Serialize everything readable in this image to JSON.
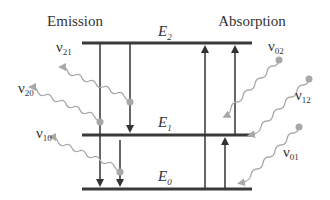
{
  "titles": {
    "emission": "Emission",
    "absorption": "Absorption"
  },
  "levels": [
    {
      "id": "E2",
      "symbol": "E",
      "sub": "2",
      "y": 43
    },
    {
      "id": "E1",
      "symbol": "E",
      "sub": "1",
      "y": 135
    },
    {
      "id": "E0",
      "symbol": "E",
      "sub": "0",
      "y": 189
    }
  ],
  "photons": {
    "nu21": {
      "symbol": "ν",
      "sub": "21"
    },
    "nu20": {
      "symbol": "ν",
      "sub": "20"
    },
    "nu10": {
      "symbol": "ν",
      "sub": "10"
    },
    "nu02": {
      "symbol": "ν",
      "sub": "02"
    },
    "nu12": {
      "symbol": "ν",
      "sub": "12"
    },
    "nu01": {
      "symbol": "ν",
      "sub": "01"
    }
  },
  "colors": {
    "level_line": "#3a3a3a",
    "transition_arrow": "#333333",
    "photon_wave": "#a8a8a8",
    "text": "#333333"
  }
}
